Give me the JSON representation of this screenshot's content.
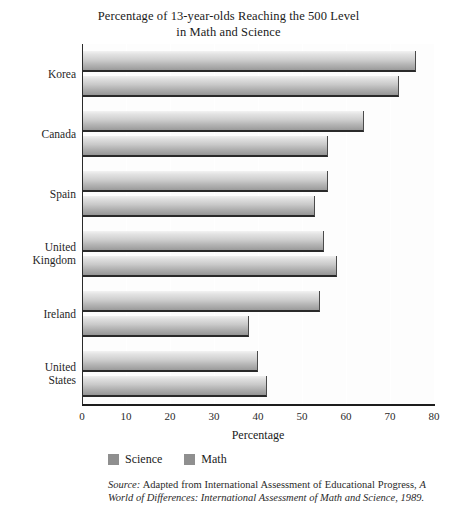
{
  "chart_data": {
    "type": "bar",
    "orientation": "horizontal",
    "title": "Percentage of 13-year-olds Reaching the 500 Level in Math and Science",
    "title_line1": "Percentage of 13-year-olds Reaching the 500 Level",
    "title_line2": "in Math and Science",
    "xlabel": "Percentage",
    "ylabel": "",
    "xlim": [
      0,
      80
    ],
    "xticks": [
      0,
      10,
      20,
      30,
      40,
      50,
      60,
      70,
      80
    ],
    "grid": true,
    "grid_axis": "x",
    "legend_position": "below-axis-left",
    "categories": [
      "Korea",
      "Canada",
      "Spain",
      "United Kingdom",
      "Ireland",
      "United States"
    ],
    "category_lines": [
      [
        "Korea"
      ],
      [
        "Canada"
      ],
      [
        "Spain"
      ],
      [
        "United",
        "Kingdom"
      ],
      [
        "Ireland"
      ],
      [
        "United",
        "States"
      ]
    ],
    "series": [
      {
        "name": "Science",
        "color": "#b4b4b4",
        "values": [
          76,
          64,
          56,
          55,
          54,
          40
        ]
      },
      {
        "name": "Math",
        "color": "#a8a8a8",
        "values": [
          72,
          56,
          53,
          58,
          38,
          42
        ]
      }
    ],
    "source_prefix": "Source:",
    "source_text": " Adapted from International Assessment of Educational Progress, ",
    "source_italic": "A World of Differences: International Assessment of Math and Science, 1989."
  },
  "legend": {
    "items": [
      {
        "label": "Science"
      },
      {
        "label": "Math"
      }
    ]
  }
}
